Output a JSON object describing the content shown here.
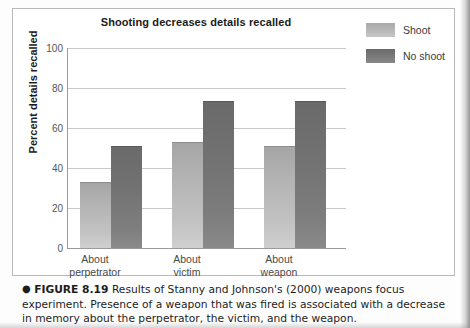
{
  "figure": {
    "caption_bullet": "●",
    "caption_label": "FIGURE 8.19",
    "caption_text": "Results of Stanny and Johnson's (2000) weapons focus experiment. Presence of a weapon that was fired is associated with a decrease in memory about the perpetrator, the victim, and the weapon."
  },
  "chart_data": {
    "type": "bar",
    "title": "Shooting decreases details recalled",
    "xlabel": "",
    "ylabel": "Percent details recalled",
    "categories": [
      "About perpetrator",
      "About victim",
      "About weapon"
    ],
    "category_lines": [
      [
        "About",
        "perpetrator"
      ],
      [
        "About",
        "victim"
      ],
      [
        "About",
        "weapon"
      ]
    ],
    "series": [
      {
        "name": "Shoot",
        "color": "#b4b4b4",
        "values": [
          33,
          53,
          51
        ]
      },
      {
        "name": "No shoot",
        "color": "#717171",
        "values": [
          51,
          73.5,
          73.5
        ]
      }
    ],
    "ylim": [
      0,
      100
    ],
    "yticks": [
      0,
      20,
      40,
      60,
      80,
      100
    ],
    "ytick_labels": [
      "0",
      "20",
      "40",
      "60",
      "80",
      "100"
    ],
    "grid": true,
    "legend_position": "top-right"
  }
}
